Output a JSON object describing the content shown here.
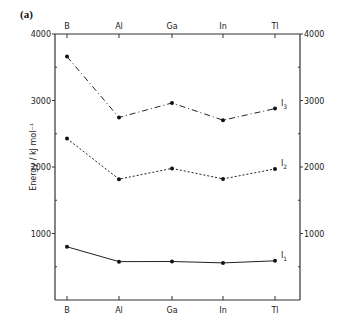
{
  "panel_label": "(a)",
  "chart_data": {
    "type": "line",
    "title": "",
    "xlabel": "",
    "ylabel": "Energy / kJ mol⁻¹",
    "categories": [
      "B",
      "Al",
      "Ga",
      "In",
      "Tl"
    ],
    "ylim": [
      0,
      4000
    ],
    "yticks_labeled": [
      1000,
      2000,
      3000,
      4000
    ],
    "yticks_minor": [
      500,
      1500,
      2500,
      3500
    ],
    "grid": false,
    "legend_position": "inline-right",
    "axes": "boxed, category labels top and bottom, value labels left and right",
    "series": [
      {
        "name": "I3",
        "label_main": "I",
        "label_sub": "3",
        "style": "dash-dot",
        "values": [
          3660,
          2745,
          2963,
          2704,
          2878
        ]
      },
      {
        "name": "I2",
        "label_main": "I",
        "label_sub": "2",
        "style": "dotted",
        "values": [
          2427,
          1817,
          1979,
          1821,
          1971
        ]
      },
      {
        "name": "I1",
        "label_main": "I",
        "label_sub": "1",
        "style": "solid",
        "values": [
          800,
          577,
          579,
          558,
          589
        ]
      }
    ]
  }
}
